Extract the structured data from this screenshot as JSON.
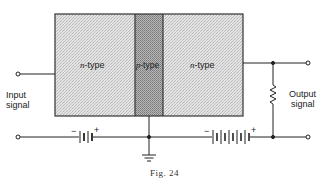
{
  "figure": {
    "caption": "Fig. 24",
    "regions": [
      {
        "id": "n-left",
        "prefix": "n",
        "suffix": "-type"
      },
      {
        "id": "p-mid",
        "prefix": "p",
        "suffix": "-type"
      },
      {
        "id": "n-right",
        "prefix": "n",
        "suffix": "-type"
      }
    ],
    "input_label": [
      "Input",
      "signal"
    ],
    "output_label": [
      "Output",
      "signal"
    ],
    "battery_left": {
      "minus": "−",
      "plus": "+"
    },
    "battery_right": {
      "minus": "−",
      "plus": "+"
    }
  }
}
